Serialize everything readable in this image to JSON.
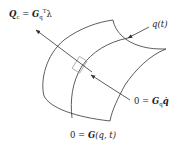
{
  "diagram": {
    "type": "constraint-manifold",
    "labels": {
      "constraint_force": {
        "lhs": "Q",
        "lhs_sub": "c",
        "equals": " = ",
        "rhs": "G",
        "rhs_sub": "q",
        "rhs_sup": "T",
        "multiplier": "λ"
      },
      "trajectory": {
        "text": "q(t)"
      },
      "velocity_constraint": {
        "lhs": "0 = ",
        "G": "G",
        "G_sub": "q",
        "qdot": "q̇"
      },
      "position_constraint": {
        "lhs": "0 = ",
        "G": "G",
        "args": "(q, t)"
      }
    },
    "colors": {
      "line": "#333333",
      "text": "#222222",
      "tangent_box": "#999999"
    }
  }
}
